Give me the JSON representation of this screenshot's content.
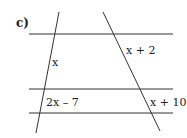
{
  "part_label": "c)",
  "lines": {
    "color": "#333333",
    "horizontal": [
      {
        "x1": 29,
        "y1": 34,
        "x2": 173,
        "y2": 34
      },
      {
        "x1": 29,
        "y1": 89,
        "x2": 173,
        "y2": 89
      },
      {
        "x1": 29,
        "y1": 113,
        "x2": 173,
        "y2": 113
      }
    ],
    "transversals": [
      {
        "x1": 59,
        "y1": 12,
        "x2": 36,
        "y2": 133
      },
      {
        "x1": 103,
        "y1": 12,
        "x2": 160,
        "y2": 131
      }
    ]
  },
  "segment_labels": {
    "left_upper": "x",
    "right_upper": "x + 2",
    "left_lower": "2x – 7",
    "right_lower": "x + 10"
  }
}
